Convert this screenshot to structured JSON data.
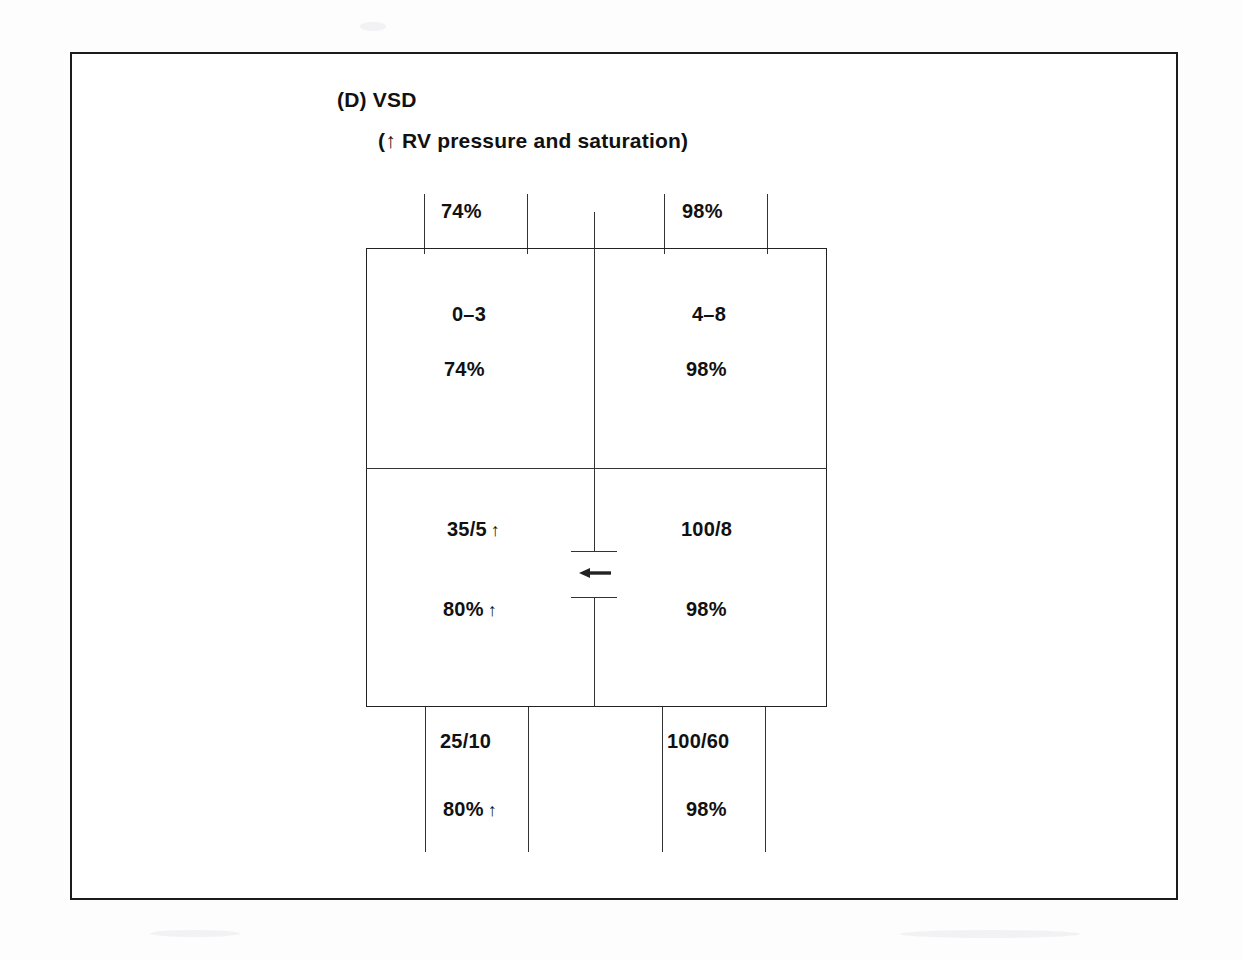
{
  "figure": {
    "label": "(D) VSD",
    "subtitle": "(↑ RV pressure and saturation)"
  },
  "diagram_data": {
    "type": "cardiac-chamber-schematic",
    "condition": "Ventricular Septal Defect",
    "shunt_direction_symbol": "←",
    "shunt_description": "left-to-right shunt across ventricular septal defect",
    "elevated_marker": "↑",
    "vessels_top": {
      "systemic_venous_return": {
        "saturation": "74%"
      },
      "pulmonary_venous_return": {
        "saturation": "98%"
      }
    },
    "chambers": {
      "right_atrium": {
        "pressure": "0–3",
        "saturation": "74%"
      },
      "left_atrium": {
        "pressure": "4–8",
        "saturation": "98%"
      },
      "right_ventricle": {
        "pressure": "35/5",
        "pressure_arrow": "↑",
        "saturation": "80%",
        "saturation_arrow": "↑"
      },
      "left_ventricle": {
        "pressure": "100/8",
        "saturation": "98%"
      }
    },
    "vessels_bottom": {
      "pulmonary_artery": {
        "pressure": "25/10",
        "saturation": "80%",
        "saturation_arrow": "↑"
      },
      "aorta": {
        "pressure": "100/60",
        "saturation": "98%"
      }
    }
  },
  "colors": {
    "ink": "#111111",
    "line": "#333333",
    "frame": "#1b1b1b",
    "page": "#ffffff"
  }
}
